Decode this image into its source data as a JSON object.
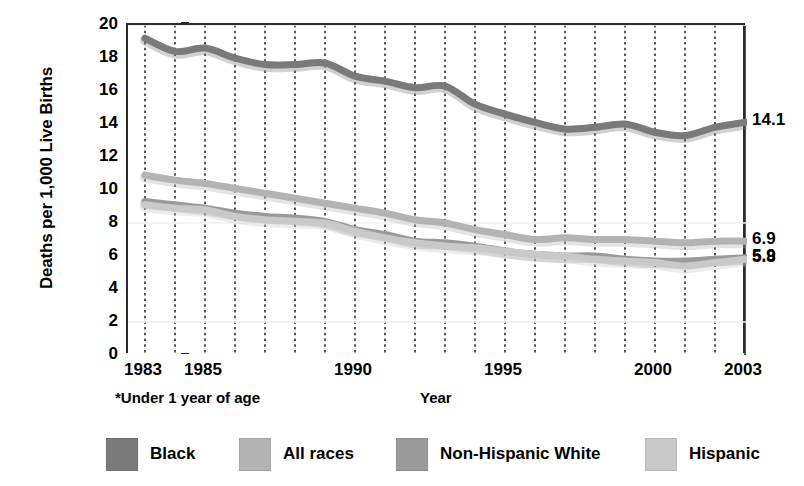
{
  "chart_data": {
    "type": "line",
    "title": "",
    "xlabel": "Year",
    "ylabel": "Deaths per 1,000 Live Births",
    "xlim": [
      1983,
      2003
    ],
    "ylim": [
      0,
      20
    ],
    "ytick_values": [
      0,
      2,
      4,
      6,
      8,
      10,
      12,
      14,
      16,
      18,
      20
    ],
    "xtick_values": [
      1983,
      1985,
      1990,
      1995,
      2000,
      2003
    ],
    "xtick_labels": [
      "1983",
      "1985",
      "1990",
      "1995",
      "2000",
      "2003"
    ],
    "grid": "vertical-dotted",
    "legend_position": "bottom",
    "footnote": "*Under 1 year of age",
    "x": [
      1983,
      1984,
      1985,
      1986,
      1987,
      1988,
      1989,
      1990,
      1991,
      1992,
      1993,
      1994,
      1995,
      1996,
      1997,
      1998,
      1999,
      2000,
      2001,
      2002,
      2003
    ],
    "series": [
      {
        "name": "Black",
        "color": "#7a7a7a",
        "end_label": "14.1",
        "values": [
          19.2,
          18.4,
          18.6,
          18.0,
          17.6,
          17.6,
          17.7,
          16.9,
          16.6,
          16.2,
          16.3,
          15.2,
          14.6,
          14.1,
          13.7,
          13.8,
          14.0,
          13.5,
          13.3,
          13.8,
          14.1
        ]
      },
      {
        "name": "All races",
        "color": "#b3b3b3",
        "end_label": "6.9",
        "values": [
          10.9,
          10.6,
          10.4,
          10.1,
          9.8,
          9.5,
          9.2,
          8.9,
          8.6,
          8.2,
          8.0,
          7.6,
          7.3,
          7.0,
          7.1,
          7.0,
          7.0,
          6.9,
          6.8,
          6.9,
          6.9
        ]
      },
      {
        "name": "Non-Hispanic White",
        "color": "#9a9a9a",
        "end_label": "5.9",
        "values": [
          9.3,
          9.1,
          8.9,
          8.6,
          8.4,
          8.3,
          8.1,
          7.6,
          7.3,
          6.9,
          6.8,
          6.6,
          6.3,
          6.1,
          6.0,
          6.0,
          5.8,
          5.7,
          5.7,
          5.8,
          5.9
        ]
      },
      {
        "name": "Hispanic",
        "color": "#c9c9c9",
        "end_label": "5.8",
        "values": [
          9.1,
          8.9,
          8.8,
          8.4,
          8.2,
          8.1,
          8.0,
          7.5,
          7.1,
          6.8,
          6.6,
          6.5,
          6.3,
          6.1,
          6.0,
          5.8,
          5.7,
          5.6,
          5.4,
          5.6,
          5.8
        ]
      }
    ],
    "end_labels": [
      {
        "series": "Black",
        "text": "14.1",
        "value": 14.1
      },
      {
        "series": "All races",
        "text": "6.9",
        "value": 6.9
      },
      {
        "series": "Non-Hispanic White",
        "text": "5.9",
        "value": 5.9
      },
      {
        "series": "Hispanic",
        "text": "5.8",
        "value": 5.8
      }
    ]
  },
  "legend": {
    "items": [
      {
        "label": "Black",
        "color": "#7a7a7a"
      },
      {
        "label": "All races",
        "color": "#b3b3b3"
      },
      {
        "label": "Non-Hispanic White",
        "color": "#9a9a9a"
      },
      {
        "label": "Hispanic",
        "color": "#c9c9c9"
      }
    ]
  }
}
